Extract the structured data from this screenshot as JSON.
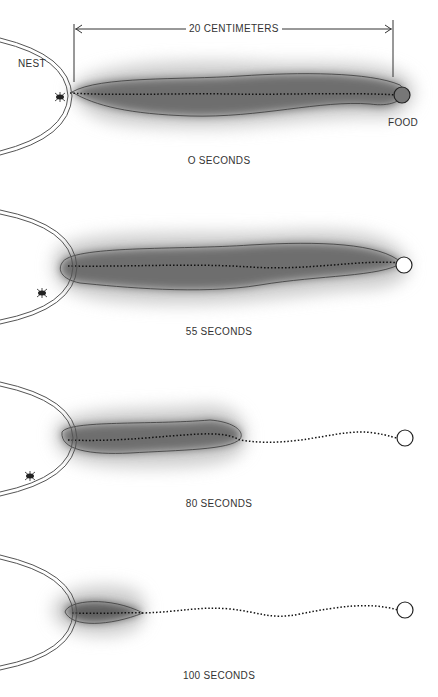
{
  "figure": {
    "nest_label": "NEST",
    "food_label": "FOOD",
    "distance_label": "20 CENTIMETERS",
    "colors": {
      "trail_dark": "#4a4a4a",
      "trail_mid": "#8c8c8c",
      "trail_light": "#d9d9d9",
      "line": "#333333",
      "background": "#ffffff"
    },
    "panels": [
      {
        "caption": "O SECONDS",
        "trail_extent": "nest-to-food",
        "ant_position": "at-nest-entrance"
      },
      {
        "caption": "55 SECONDS",
        "trail_extent": "nest-to-food",
        "ant_position": "outside-nest-below"
      },
      {
        "caption": "80 SECONDS",
        "trail_extent": "partial (about half way)",
        "ant_position": "outside-nest-below"
      },
      {
        "caption": "100 SECONDS",
        "trail_extent": "short (near nest)",
        "ant_position": "none visible"
      }
    ]
  }
}
